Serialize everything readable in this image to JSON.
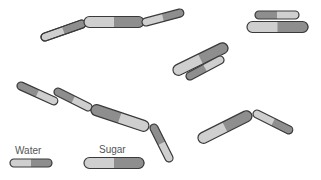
{
  "colors": {
    "light": "#cfcfcf",
    "dark": "#8e8e8e",
    "outline": "#3a3a3a",
    "text": "#555555"
  },
  "legend": {
    "water_label": "Water",
    "sugar_label": "Sugar"
  },
  "molecules": [
    {
      "type": "water",
      "x1": 45,
      "y1": 37,
      "x2": 82,
      "y2": 24,
      "first": "light"
    },
    {
      "type": "sugar",
      "x1": 89,
      "y1": 22,
      "x2": 139,
      "y2": 22,
      "first": "light"
    },
    {
      "type": "water",
      "x1": 146,
      "y1": 22,
      "x2": 180,
      "y2": 13,
      "first": "light"
    },
    {
      "type": "water",
      "x1": 259,
      "y1": 15,
      "x2": 295,
      "y2": 15,
      "first": "dark"
    },
    {
      "type": "sugar",
      "x1": 252,
      "y1": 27,
      "x2": 303,
      "y2": 27,
      "first": "light"
    },
    {
      "type": "sugar",
      "x1": 178,
      "y1": 70,
      "x2": 223,
      "y2": 48,
      "first": "light"
    },
    {
      "type": "water",
      "x1": 190,
      "y1": 76,
      "x2": 220,
      "y2": 60,
      "first": "dark"
    },
    {
      "type": "water",
      "x1": 21,
      "y1": 86,
      "x2": 54,
      "y2": 101,
      "first": "dark"
    },
    {
      "type": "water",
      "x1": 58,
      "y1": 92,
      "x2": 88,
      "y2": 107,
      "first": "dark"
    },
    {
      "type": "sugar",
      "x1": 96,
      "y1": 110,
      "x2": 144,
      "y2": 126,
      "first": "dark"
    },
    {
      "type": "water",
      "x1": 154,
      "y1": 128,
      "x2": 169,
      "y2": 158,
      "first": "dark"
    },
    {
      "type": "sugar",
      "x1": 203,
      "y1": 138,
      "x2": 247,
      "y2": 116,
      "first": "light"
    },
    {
      "type": "water",
      "x1": 257,
      "y1": 114,
      "x2": 289,
      "y2": 130,
      "first": "light"
    }
  ]
}
